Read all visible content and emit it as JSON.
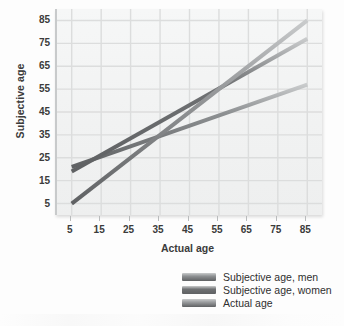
{
  "chart_data": {
    "type": "line",
    "title": "",
    "xlabel": "Actual age",
    "ylabel": "Subjective age",
    "xlim": [
      0,
      90
    ],
    "ylim": [
      0,
      90
    ],
    "xticks": [
      5,
      15,
      25,
      35,
      45,
      55,
      65,
      75,
      85
    ],
    "yticks": [
      5,
      15,
      25,
      35,
      45,
      55,
      65,
      75,
      85
    ],
    "grid": true,
    "legend_position": "bottom-right",
    "x": [
      5,
      85
    ],
    "series": [
      {
        "name": "Subjective age, men",
        "values": [
          21,
          57
        ],
        "color": "#8d9092",
        "linewidth": 4
      },
      {
        "name": "Subjective age, women",
        "values": [
          19,
          77
        ],
        "color": "#6f7173",
        "linewidth": 4
      },
      {
        "name": "Actual age",
        "values": [
          5,
          85
        ],
        "color": "#9a9c9e",
        "linewidth": 4
      }
    ]
  },
  "axes": {
    "y_title": "Subjective age",
    "x_title": "Actual age",
    "y_tick_labels": [
      "85",
      "75",
      "65",
      "55",
      "45",
      "35",
      "25",
      "15",
      "5"
    ],
    "x_tick_labels": [
      "5",
      "15",
      "25",
      "35",
      "45",
      "55",
      "65",
      "75",
      "85"
    ]
  },
  "legend": {
    "items": [
      {
        "label": "Subjective age, men",
        "color": "#8d9092"
      },
      {
        "label": "Subjective age, women",
        "color": "#6f7173"
      },
      {
        "label": "Actual age",
        "color": "#9a9c9e"
      }
    ]
  },
  "colors": {
    "page_background": "#fdfdfd",
    "plot_background": "#f2f3f3",
    "gridline": "#dcdddd",
    "axis_text": "#3b3b3b"
  }
}
